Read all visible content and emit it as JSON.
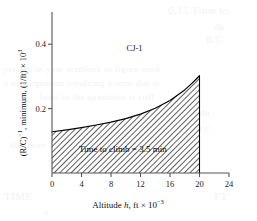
{
  "chart_data": {
    "type": "area",
    "title": "",
    "subtitle": "",
    "xlabel": "Altitude h, ft × 10⁻³",
    "xlabel_parts": {
      "prefix": "Altitude ",
      "variable": "h",
      "suffix": ", ft × 10",
      "exponent": "−3"
    },
    "ylabel": "(R/C)⁻¹, minimum, (1/ft) × 10³",
    "ylabel_parts": {
      "base": "(R/C)",
      "base_exponent": "−1",
      "middle": ", minimum, (1/ft) × 10",
      "tail_exponent": "3"
    },
    "xlim": [
      0,
      24
    ],
    "ylim": [
      0,
      0.5
    ],
    "xticks": [
      0,
      4,
      8,
      12,
      16,
      20,
      24
    ],
    "xtick_labels": [
      "0",
      "4",
      "8",
      "12",
      "16",
      "20",
      "24"
    ],
    "yticks": [
      0.2,
      0.4
    ],
    "ytick_labels": [
      "0.2",
      "0.4"
    ],
    "grid": false,
    "legend": false,
    "series": [
      {
        "name": "CJ-1",
        "label": "CJ-1",
        "x": [
          0,
          2,
          4,
          6,
          8,
          10,
          12,
          14,
          16,
          18,
          19,
          20
        ],
        "values": [
          0.128,
          0.134,
          0.141,
          0.149,
          0.158,
          0.169,
          0.183,
          0.201,
          0.225,
          0.258,
          0.279,
          0.302
        ],
        "fill": "hatched",
        "fill_angle_deg": 45,
        "line_color": "#000000",
        "x_end": 20
      }
    ],
    "annotations": [
      {
        "name": "time-to-climb",
        "text": "Time to climb = 3.5 min",
        "x": 9.6,
        "y": 0.075
      },
      {
        "name": "series-label",
        "text": "CJ-1",
        "x": 11.2,
        "y": 0.405
      }
    ]
  },
  "bleed_text": {
    "lines": [
      {
        "text": "6.15  Time to",
        "x": 168,
        "y": 4,
        "size": 11
      },
      {
        "text": "dh",
        "x": 214,
        "y": 22,
        "size": 9
      },
      {
        "text": "R/C",
        "x": 206,
        "y": 34,
        "size": 10
      },
      {
        "text": "present in your textbook or figure used",
        "x": 4,
        "y": 64,
        "size": 9
      },
      {
        "text": "a new equation involving a term that is",
        "x": 4,
        "y": 78,
        "size": 9
      },
      {
        "text": "lated to the quantities is still",
        "x": 40,
        "y": 92,
        "size": 9
      },
      {
        "text": "dh",
        "x": 200,
        "y": 108,
        "size": 9
      },
      {
        "text": "R/C",
        "x": 196,
        "y": 124,
        "size": 9
      },
      {
        "text": "the curve to the right of",
        "x": 10,
        "y": 140,
        "size": 9
      },
      {
        "text": "TIME",
        "x": 4,
        "y": 190,
        "size": 11
      },
      {
        "text": "FT",
        "x": 214,
        "y": 190,
        "size": 11
      },
      {
        "text": "o",
        "x": 44,
        "y": 208,
        "size": 8
      }
    ]
  },
  "colors": {
    "axis": "#555555",
    "curve": "#000000",
    "hatch": "#2b2b2b",
    "text": "#111111",
    "background": "#ffffff",
    "bleed": "#f2f2f2"
  }
}
